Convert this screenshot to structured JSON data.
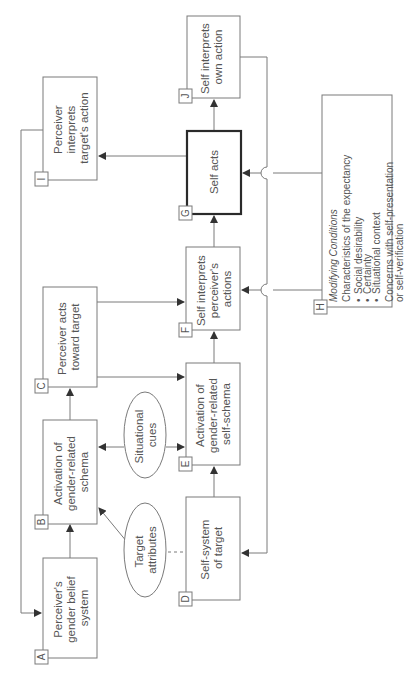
{
  "diagram": {
    "orientation": "rotated-90-ccw",
    "nodes": {
      "A": {
        "letter": "A",
        "lines": [
          "Perceiver's",
          "gender belief",
          "system"
        ]
      },
      "B": {
        "letter": "B",
        "lines": [
          "Activation of",
          "gender-related",
          "schema"
        ]
      },
      "C": {
        "letter": "C",
        "lines": [
          "Perceiver acts",
          "toward target"
        ]
      },
      "D": {
        "letter": "D",
        "lines": [
          "Self-system",
          "of target"
        ]
      },
      "E": {
        "letter": "E",
        "lines": [
          "Activation of",
          "gender-related",
          "self-schema"
        ]
      },
      "F": {
        "letter": "F",
        "lines": [
          "Self interprets",
          "perceiver's",
          "actions"
        ]
      },
      "G": {
        "letter": "G",
        "lines": [
          "Self acts"
        ]
      },
      "I": {
        "letter": "I",
        "lines": [
          "Perceiver",
          "interprets",
          "target's action"
        ]
      },
      "J": {
        "letter": "J",
        "lines": [
          "Self interprets",
          "own action"
        ]
      },
      "H": {
        "letter": "H",
        "title": "Modifying Conditions",
        "subtitle": "Characteristics of the expectancy",
        "bullets": [
          "Social desirability",
          "Certainty",
          "Situational context"
        ],
        "extra": [
          "Concerns with self-presentation",
          "or self-verification"
        ]
      }
    },
    "ellipses": {
      "situational": {
        "lines": [
          "Situational",
          "cues"
        ]
      },
      "target": {
        "lines": [
          "Target",
          "attributes"
        ]
      }
    },
    "edges": [
      {
        "from": "A",
        "to": "B"
      },
      {
        "from": "B",
        "to": "C"
      },
      {
        "from": "C",
        "to": "E"
      },
      {
        "from": "C",
        "to": "F"
      },
      {
        "from": "D",
        "to": "E"
      },
      {
        "from": "E",
        "to": "F"
      },
      {
        "from": "F",
        "to": "G"
      },
      {
        "from": "G",
        "to": "J"
      },
      {
        "from": "G",
        "to": "I"
      },
      {
        "from": "I",
        "to": "A"
      },
      {
        "from": "J",
        "to": "D"
      },
      {
        "from": "H",
        "to": "G"
      },
      {
        "from": "H",
        "to": "F"
      },
      {
        "from": "Situational cues",
        "to": "B"
      },
      {
        "from": "Situational cues",
        "to": "E"
      },
      {
        "from": "Target attributes",
        "to": "B"
      },
      {
        "from": "Target attributes",
        "to": "D",
        "style": "dashed"
      }
    ]
  }
}
